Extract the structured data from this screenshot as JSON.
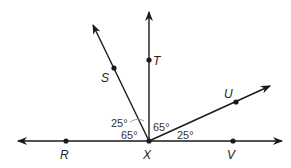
{
  "diagram": {
    "type": "geometry-angles",
    "vertex": {
      "label": "X",
      "x": 149,
      "y": 141
    },
    "line": {
      "name": "line RV",
      "x1": 18,
      "y1": 141,
      "x2": 282,
      "y2": 141
    },
    "rays": [
      {
        "name": "ray XT",
        "x2": 149,
        "y2": 12
      },
      {
        "name": "ray XS",
        "x2": 93,
        "y2": 25
      },
      {
        "name": "ray XU",
        "x2": 270,
        "y2": 86
      }
    ],
    "points": [
      {
        "label": "R",
        "x": 66,
        "y": 141,
        "lx": 60,
        "ly": 159
      },
      {
        "label": "V",
        "x": 233,
        "y": 141,
        "lx": 227,
        "ly": 159
      },
      {
        "label": "T",
        "x": 149,
        "y": 60,
        "lx": 153,
        "ly": 65
      },
      {
        "label": "S",
        "x": 114,
        "y": 68,
        "lx": 101,
        "ly": 82
      },
      {
        "label": "U",
        "x": 236,
        "y": 102,
        "lx": 224,
        "ly": 98
      },
      {
        "label": "X",
        "x": 149,
        "y": 141,
        "lx": 143,
        "ly": 159
      }
    ],
    "angles": [
      {
        "label": "25°",
        "x": 112,
        "y": 127
      },
      {
        "label": "65°",
        "x": 121,
        "y": 139
      },
      {
        "label": "65°",
        "x": 153,
        "y": 131
      },
      {
        "label": "25°",
        "x": 177,
        "y": 139
      }
    ],
    "colors": {
      "stroke": "#1a1a1a",
      "background": "#ffffff"
    }
  }
}
